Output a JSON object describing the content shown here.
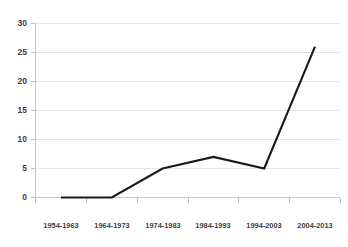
{
  "chart_data": {
    "type": "line",
    "title": "",
    "subtitle": "",
    "xlabel": "",
    "ylabel": "",
    "categories": [
      "1954-1963",
      "1964-1973",
      "1974-1983",
      "1984-1993",
      "1994-2003",
      "2004-2013"
    ],
    "values": [
      0,
      0,
      5,
      7,
      5,
      26
    ],
    "series": [
      {
        "name": "",
        "values": [
          0,
          0,
          5,
          7,
          5,
          26
        ]
      }
    ],
    "ylim": [
      0,
      30
    ],
    "yticks": [
      0,
      5,
      10,
      15,
      20,
      25,
      30
    ],
    "ytick_labels": [
      "0",
      "5",
      "10",
      "15",
      "20",
      "25",
      "30"
    ],
    "grid": "horizontal",
    "legend": "none",
    "colors": {
      "line": "#1a1a1a",
      "grid": "#e4e4e4",
      "axis": "#c9c9c9",
      "text": "#3f3f3f",
      "background": "#ffffff"
    }
  }
}
